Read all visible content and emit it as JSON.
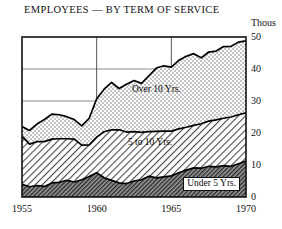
{
  "chart_data": {
    "type": "area",
    "title": "EMPLOYEES — BY TERM OF SERVICE",
    "subtitle": "",
    "unit_label": "Thous",
    "xlabel": "",
    "ylabel": "Thous",
    "xlim": [
      1955,
      1970
    ],
    "ylim": [
      0,
      50
    ],
    "grid": true,
    "stacked": true,
    "legend_position": "inside-bands",
    "xticks": [
      1955,
      1960,
      1965,
      1970
    ],
    "xtick_labels": [
      "1955",
      "1960",
      "1965",
      "1970"
    ],
    "yticks": [
      0,
      10,
      20,
      30,
      40,
      50
    ],
    "ytick_labels": [
      "0",
      "10",
      "20",
      "30",
      "40",
      "50"
    ],
    "x": [
      1955,
      1955.5,
      1956,
      1956.5,
      1957,
      1957.5,
      1958,
      1958.5,
      1959,
      1959.5,
      1960,
      1960.5,
      1961,
      1961.5,
      1962,
      1962.5,
      1963,
      1963.5,
      1964,
      1964.5,
      1965,
      1965.5,
      1966,
      1966.5,
      1967,
      1967.5,
      1968,
      1968.5,
      1969,
      1969.5,
      1970
    ],
    "series": [
      {
        "name": "Under 5 Yrs.",
        "label": "Under 5 Yrs.",
        "fill": "dark-hatch",
        "color": "#8a8a8a",
        "values": [
          4.0,
          3.2,
          3.6,
          3.3,
          4.4,
          4.6,
          5.2,
          4.7,
          5.4,
          6.4,
          7.6,
          6.0,
          5.2,
          4.4,
          4.2,
          5.0,
          5.4,
          6.5,
          6.0,
          6.3,
          6.6,
          7.6,
          8.4,
          9.1,
          9.0,
          9.6,
          9.4,
          9.8,
          9.6,
          10.4,
          11.2
        ]
      },
      {
        "name": "5 to 10 Yrs.",
        "label": "5 to 10 Yrs.",
        "fill": "diagonal-hatch",
        "color": "#d9d9d9",
        "values": [
          15.0,
          13.3,
          13.7,
          14.0,
          13.7,
          13.6,
          13.0,
          13.4,
          10.8,
          9.9,
          11.1,
          14.4,
          15.8,
          16.6,
          16.1,
          15.4,
          14.8,
          13.9,
          14.5,
          14.3,
          14.0,
          13.7,
          13.4,
          13.3,
          13.9,
          14.1,
          14.7,
          14.8,
          15.4,
          15.3,
          15.1
        ]
      },
      {
        "name": "Over 10 Yrs.",
        "label": "Over 10 Yrs.",
        "fill": "stipple",
        "color": "#e4e4e4",
        "values": [
          3.0,
          4.3,
          5.5,
          6.9,
          7.8,
          7.5,
          6.9,
          6.1,
          6.0,
          8.3,
          12.0,
          13.3,
          14.8,
          12.9,
          14.9,
          16.0,
          15.3,
          17.5,
          19.8,
          20.4,
          20.0,
          21.4,
          22.2,
          22.4,
          20.6,
          21.6,
          21.5,
          22.4,
          22.1,
          22.7,
          22.5
        ]
      }
    ],
    "totals": [
      22.0,
      20.8,
      22.8,
      24.2,
      25.9,
      25.7,
      25.1,
      24.2,
      22.2,
      24.6,
      30.7,
      33.7,
      35.8,
      33.9,
      35.2,
      36.4,
      35.5,
      37.9,
      40.3,
      41.0,
      40.6,
      42.7,
      44.0,
      44.8,
      43.5,
      45.3,
      45.6,
      47.0,
      47.1,
      48.4,
      48.8
    ],
    "annotations": [
      {
        "text": "Over 10 Yrs.",
        "x": 1964.0,
        "y": 33.0
      },
      {
        "text": "5 to 10 Yrs.",
        "x": 1963.6,
        "y": 16.5
      },
      {
        "text": "Under 5 Yrs.",
        "x": 1967.7,
        "y": 4.2
      }
    ]
  },
  "colors": {
    "frame": "#111111",
    "grid": "#6f6f6f",
    "line": "#000000",
    "background": "#ffffff"
  }
}
